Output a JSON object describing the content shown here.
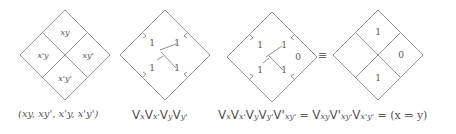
{
  "diagrams": [
    {
      "id": "karnaugh-labels",
      "cells": {
        "top": "xy",
        "left": "x'y",
        "right": "xy'",
        "bottom": "x'y'"
      },
      "caption": "(xy, xy', x'y, x'y')"
    },
    {
      "id": "four-voids",
      "values": {
        "top_left": "1",
        "top_right": "1",
        "bottom_left": "1",
        "bottom_right": "1"
      },
      "caption_parts": [
        "V",
        "x",
        "V",
        "x'",
        "V",
        "y",
        "V",
        "y'"
      ]
    },
    {
      "id": "four-voids-plus-xy'",
      "values": {
        "top_left": "1",
        "top_right": "1",
        "bottom_left": "1",
        "bottom_right": "1",
        "right": "0"
      },
      "caption_parts": [
        "V",
        "x",
        "V",
        "x'",
        "V",
        "y",
        "V",
        "y'",
        "V'",
        "xy'",
        "=",
        "V",
        "xy",
        "V'",
        "xy'",
        "V",
        "x'y'",
        "=",
        "(x ⇒ y)"
      ]
    },
    {
      "id": "implication-result",
      "values": {
        "top": "1",
        "left": "",
        "right": "0",
        "bottom": "1"
      }
    }
  ],
  "equivalence_symbol": "≡",
  "captions": {
    "c1": "(xy, xy', x'y, x'y')",
    "c2_parts": {
      "v1": "V",
      "s1": "x",
      "v2": "V",
      "s2": "x'",
      "v3": "V",
      "s3": "y",
      "v4": "V",
      "s4": "y'"
    },
    "c3_parts": {
      "v1": "V",
      "s1": "x",
      "v2": "V",
      "s2": "x'",
      "v3": "V",
      "s3": "y",
      "v4": "V",
      "s4": "y'",
      "v5": "V'",
      "s5": "xy'",
      "eq1": "=",
      "v6": "V",
      "s6": "xy",
      "v7": "V'",
      "s7": "xy'",
      "v8": "V",
      "s8": "x'y'",
      "eq2": "=",
      "result": "(x ⇒ y)"
    }
  }
}
